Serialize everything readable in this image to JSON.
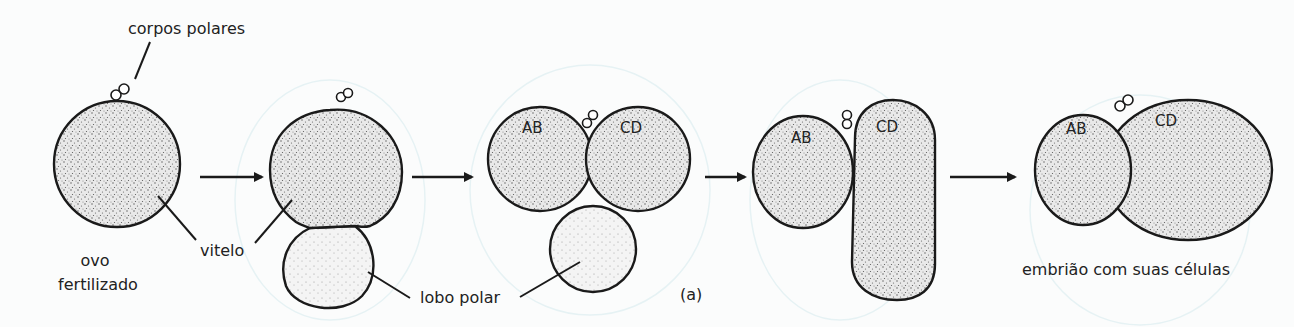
{
  "diagram": {
    "panel_label": "(a)",
    "labels": {
      "polar_bodies": "corpos polares",
      "fertilized_egg_line1": "ovo",
      "fertilized_egg_line2": "fertilizado",
      "yolk": "vitelo",
      "polar_lobe": "lobo polar",
      "embryo": "embrião com suas células"
    },
    "cells": {
      "ab": "AB",
      "cd": "CD"
    },
    "stages": [
      {
        "id": "stage-1",
        "description": "ovo fertilizado"
      },
      {
        "id": "stage-2",
        "description": "formação do lobo polar"
      },
      {
        "id": "stage-3",
        "description": "primeira clivagem: AB e CD com lobo polar"
      },
      {
        "id": "stage-4",
        "description": "lobo polar absorvido por CD"
      },
      {
        "id": "stage-5",
        "description": "embrião com duas células"
      }
    ],
    "colors": {
      "ink": "#1a1a1a",
      "background": "#fbfcfc",
      "stipple": "#555555"
    }
  }
}
